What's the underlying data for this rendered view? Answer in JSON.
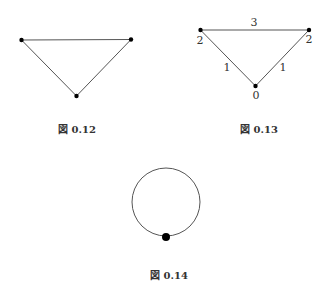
{
  "figures": [
    {
      "id": "fig-0-12",
      "caption": "図 0.12",
      "vertices": [
        [
          21.5,
          40
        ],
        [
          131,
          39.5
        ],
        [
          76.5,
          96
        ]
      ],
      "edges": [
        [
          0,
          1
        ],
        [
          0,
          2
        ],
        [
          1,
          2
        ]
      ]
    },
    {
      "id": "fig-0-13",
      "caption": "図 0.13",
      "vertices": [
        [
          200.5,
          30
        ],
        [
          309,
          30
        ],
        [
          255.5,
          86
        ]
      ],
      "vertex_labels": [
        "2",
        "2",
        "0"
      ],
      "edge_labels": {
        "top": "3",
        "left": "1",
        "right": "1"
      }
    },
    {
      "id": "fig-0-14",
      "caption": "図 0.14",
      "circle": {
        "cx": 166,
        "cy": 202,
        "r": 34
      },
      "dot": {
        "cx": 166,
        "cy": 237,
        "r": 4
      }
    }
  ],
  "colors": {
    "line": "#555555",
    "vertex": "#000000",
    "background": "#ffffff"
  }
}
